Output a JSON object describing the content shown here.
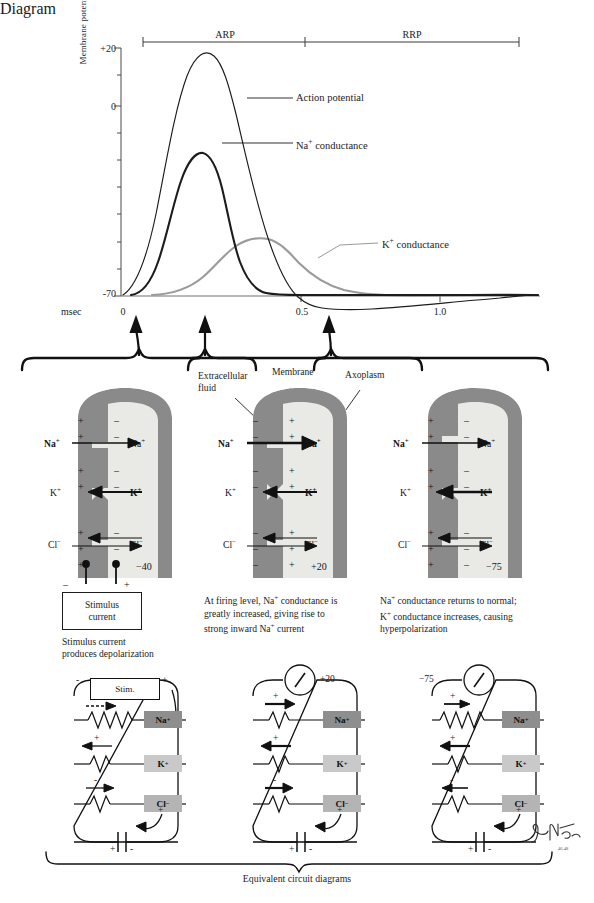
{
  "graph": {
    "y_axis_title": "Membrane potential (mV)",
    "y_ticks": [
      "+20",
      "0",
      "-70"
    ],
    "x_unit": "msec",
    "x_ticks": [
      "0",
      "0.5",
      "1.0"
    ],
    "periods": [
      {
        "key": "arp",
        "label": "ARP"
      },
      {
        "key": "rrp",
        "label": "RRP"
      }
    ],
    "curve_labels": {
      "action_potential": "Action potential",
      "na_conductance": "Na+ conductance",
      "k_conductance": "K+ conductance"
    }
  },
  "chart_data": {
    "type": "line",
    "title": "",
    "xlabel": "msec",
    "ylabel": "Membrane potential (mV)",
    "xlim": [
      0,
      1.35
    ],
    "ylim": [
      -70,
      20
    ],
    "grid": false,
    "legend": "inline-callouts",
    "xticks": [
      0,
      0.5,
      1.0
    ],
    "yticks": [
      20,
      0,
      -70
    ],
    "annotations": [
      {
        "text": "ARP",
        "x_start": 0.0,
        "x_end": 0.62,
        "y": 20
      },
      {
        "text": "RRP",
        "x_start": 0.62,
        "x_end": 1.35,
        "y": 20
      }
    ],
    "series": [
      {
        "name": "Action potential",
        "color": "#1c1c1c",
        "width": 1.1,
        "x": [
          0.0,
          0.05,
          0.1,
          0.14,
          0.17,
          0.2,
          0.23,
          0.26,
          0.3,
          0.34,
          0.38,
          0.42,
          0.46,
          0.5,
          0.54,
          0.58,
          0.62,
          0.66,
          0.72,
          0.8,
          0.9,
          1.0,
          1.1,
          1.2,
          1.35
        ],
        "y": [
          -70,
          -64,
          -52,
          -30,
          -2,
          10,
          17,
          19,
          16,
          10,
          3,
          -6,
          -16,
          -27,
          -39,
          -51,
          -62,
          -70,
          -74,
          -75,
          -74,
          -73,
          -72,
          -71,
          -70
        ]
      },
      {
        "name": "Na+ conductance",
        "color": "#1c1c1c",
        "width": 2.1,
        "x": [
          0.0,
          0.06,
          0.11,
          0.15,
          0.18,
          0.21,
          0.24,
          0.27,
          0.31,
          0.35,
          0.4,
          0.45,
          0.5,
          0.54,
          0.58,
          0.62,
          0.7,
          0.85,
          1.0,
          1.35
        ],
        "y": [
          -70,
          -70,
          -68,
          -55,
          -30,
          -10,
          -4,
          -6,
          -14,
          -24,
          -35,
          -44,
          -52,
          -59,
          -65,
          -69,
          -70,
          -70,
          -70,
          -70
        ]
      },
      {
        "name": "K+ conductance",
        "color": "#9a9a9a",
        "width": 2.1,
        "x": [
          0.0,
          0.1,
          0.16,
          0.22,
          0.28,
          0.34,
          0.4,
          0.46,
          0.52,
          0.58,
          0.64,
          0.72,
          0.82,
          0.92,
          1.02,
          1.12,
          1.22,
          1.35
        ],
        "y": [
          -70,
          -70,
          -68,
          -64,
          -58,
          -51,
          -45,
          -41,
          -40,
          -41,
          -44,
          -49,
          -55,
          -60,
          -64,
          -67,
          -69,
          -69
        ]
      }
    ]
  },
  "axon_panels": [
    {
      "key": "panel-1",
      "voltage": "-40",
      "left_ions": [
        {
          "label": "Na+",
          "bold": true
        },
        {
          "label": "K+",
          "bold": false
        },
        {
          "label": "Cl-",
          "bold": false
        }
      ],
      "right_ions": [
        {
          "label": "Na+",
          "bold": false
        },
        {
          "label": "K+",
          "bold": true
        },
        {
          "label": "Cl-",
          "bold": false
        }
      ],
      "outside_sign": "+",
      "inside_sign": "-",
      "stimulus_box": [
        "Stimulus",
        "current"
      ],
      "caption": "Stimulus current\nproduces depolarization"
    },
    {
      "key": "panel-2",
      "voltage": "+20",
      "left_ions": [
        {
          "label": "Na+",
          "bold": true
        },
        {
          "label": "K+",
          "bold": false
        },
        {
          "label": "Cl-",
          "bold": false
        }
      ],
      "right_ions": [
        {
          "label": "Na+",
          "bold": true
        },
        {
          "label": "K+",
          "bold": true
        },
        {
          "label": "Cl-",
          "bold": false
        }
      ],
      "outside_sign": "-",
      "inside_sign": "+",
      "caption": "At firing level, Na+ conductance is\ngreatly increased, giving rise to\nstrong inward Na+ current"
    },
    {
      "key": "panel-3",
      "voltage": "-75",
      "left_ions": [
        {
          "label": "Na+",
          "bold": true
        },
        {
          "label": "K+",
          "bold": false
        },
        {
          "label": "Cl-",
          "bold": false
        }
      ],
      "right_ions": [
        {
          "label": "Na+",
          "bold": false
        },
        {
          "label": "K+",
          "bold": true
        },
        {
          "label": "Cl-",
          "bold": false
        }
      ],
      "outside_sign": "+",
      "inside_sign": "-",
      "caption": "Na+ conductance returns to normal;\nK+ conductance increases, causing\nhyperpolarization"
    }
  ],
  "axon_annotations": {
    "extracellular_fluid": "Extracellular\nfluid",
    "membrane": "Membrane",
    "axoplasm": "Axoplasm"
  },
  "circuits": [
    {
      "key": "circuit-1",
      "source_type": "stimulator",
      "source_label": "Stim.",
      "meter_value": "",
      "top_left_sign": "-",
      "top_right_sign": "+",
      "channels": [
        {
          "ion": "Na+",
          "class": "na",
          "arrow": "right",
          "arrow_style": "dashed",
          "sign": ""
        },
        {
          "ion": "K+",
          "class": "k",
          "arrow": "left",
          "arrow_style": "solid",
          "sign": "+"
        },
        {
          "ion": "Cl-",
          "class": "cl",
          "arrow": "right",
          "arrow_style": "solid",
          "sign": "-"
        }
      ],
      "cap_left_sign": "+",
      "cap_right_sign": "-",
      "inner_sign": "+"
    },
    {
      "key": "circuit-2",
      "source_type": "meter",
      "source_label": "",
      "meter_value": "+20",
      "channels": [
        {
          "ion": "Na+",
          "class": "na",
          "arrow": "right",
          "arrow_style": "solid",
          "sign": "+"
        },
        {
          "ion": "K+",
          "class": "k",
          "arrow": "left",
          "arrow_style": "solid",
          "sign": "+"
        },
        {
          "ion": "Cl-",
          "class": "cl",
          "arrow": "right",
          "arrow_style": "solid",
          "sign": "-"
        }
      ],
      "cap_left_sign": "+",
      "cap_right_sign": "-",
      "inner_sign": "+"
    },
    {
      "key": "circuit-3",
      "source_type": "meter",
      "source_label": "",
      "meter_value": "-75",
      "channels": [
        {
          "ion": "Na+",
          "class": "na",
          "arrow": "right",
          "arrow_style": "solid",
          "sign": "+"
        },
        {
          "ion": "K+",
          "class": "k",
          "arrow": "left",
          "arrow_style": "solid",
          "sign": "+"
        },
        {
          "ion": "Cl-",
          "class": "cl",
          "arrow": "left",
          "arrow_style": "solid",
          "sign": "-"
        }
      ],
      "cap_left_sign": "+",
      "cap_right_sign": "-",
      "inner_sign": "+"
    }
  ],
  "bottom_caption": "Equivalent circuit diagrams",
  "signature": "Netter",
  "colors": {
    "ink": "#1c1c1c",
    "gray_curve": "#9a9a9a",
    "membrane": "#8a8a8a",
    "axoplasm": "#e9e9e6",
    "na_box": "#8e8e8e",
    "k_box": "#c9c9c9",
    "cl_box": "#b4b4b4"
  }
}
